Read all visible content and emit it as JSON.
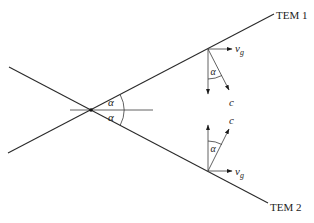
{
  "figure": {
    "labels": {
      "tem1": "TEM 1",
      "tem2": "TEM 2",
      "alpha": "α",
      "group_velocity_v": "v",
      "group_velocity_sub": "g",
      "phase_velocity": "c"
    },
    "geometry": {
      "intersection": [
        91,
        110
      ],
      "tem1_line": [
        [
          8,
          153
        ],
        [
          274,
          14
        ]
      ],
      "tem2_line": [
        [
          9,
          67
        ],
        [
          268,
          203
        ]
      ],
      "axis_line": [
        [
          70,
          110
        ],
        [
          153,
          110
        ]
      ],
      "upper_vertex": [
        208,
        49
      ],
      "lower_vertex": [
        208,
        171
      ],
      "alpha_deg": 27.7
    },
    "colors": {
      "stroke": "#2a2a2a",
      "background": "#ffffff"
    }
  }
}
